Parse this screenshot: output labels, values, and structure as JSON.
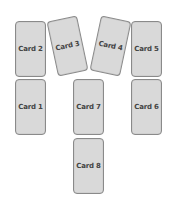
{
  "cards": [
    {
      "label": "Card 2",
      "x": 15,
      "y": 21,
      "rotate": 0
    },
    {
      "label": "Card 3",
      "x": 52,
      "y": 18,
      "rotate": -12
    },
    {
      "label": "Card 4",
      "x": 95,
      "y": 18,
      "rotate": 12
    },
    {
      "label": "Card 5",
      "x": 131,
      "y": 21,
      "rotate": 0
    },
    {
      "label": "Card 1",
      "x": 15,
      "y": 79,
      "rotate": 0
    },
    {
      "label": "Card 7",
      "x": 73,
      "y": 79,
      "rotate": 0
    },
    {
      "label": "Card 6",
      "x": 131,
      "y": 79,
      "rotate": 0
    },
    {
      "label": "Card 8",
      "x": 73,
      "y": 138,
      "rotate": 0
    }
  ],
  "colors": {
    "card_fill": "#d9d9d9",
    "card_border": "#8a8a8a",
    "text": "#444444"
  }
}
